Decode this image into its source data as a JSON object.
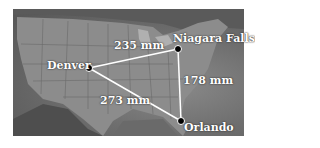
{
  "diagram": {
    "type": "map-triangle",
    "background": "United States map (grayscale)",
    "cities": [
      {
        "name": "Denver",
        "x": 89,
        "y": 68
      },
      {
        "name": "Niagara Falls",
        "x": 178,
        "y": 49
      },
      {
        "name": "Orlando",
        "x": 181,
        "y": 121
      }
    ],
    "edges": [
      {
        "from": "Denver",
        "to": "Niagara Falls",
        "label": "235 mm"
      },
      {
        "from": "Niagara Falls",
        "to": "Orlando",
        "label": "178 mm"
      },
      {
        "from": "Denver",
        "to": "Orlando",
        "label": "273 mm"
      }
    ],
    "colors": {
      "line": "#ffffff",
      "dot": "#000000",
      "label": "#ffffff",
      "map_dark": "#555555",
      "map_light": "#9a9a9a"
    }
  }
}
